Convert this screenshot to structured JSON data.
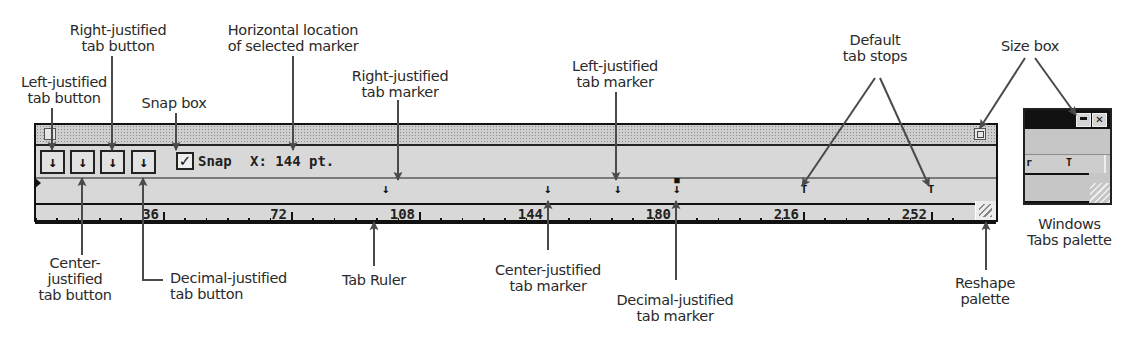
{
  "callouts": {
    "left_justified_tab_button": [
      "Left-justified",
      "tab button"
    ],
    "right_justified_tab_button": [
      "Right-justified",
      "tab button"
    ],
    "snap_box": [
      "Snap box"
    ],
    "horizontal_location": [
      "Horizontal location",
      "of selected marker"
    ],
    "right_justified_tab_marker": [
      "Right-justified",
      "tab marker"
    ],
    "left_justified_tab_marker": [
      "Left-justified",
      "tab marker"
    ],
    "default_tab_stops": [
      "Default",
      "tab stops"
    ],
    "size_box": [
      "Size box"
    ],
    "center_justified_tab_button": [
      "Center-",
      "justified",
      "tab button"
    ],
    "decimal_justified_tab_button": [
      "Decimal-justified",
      "tab button"
    ],
    "tab_ruler": [
      "Tab Ruler"
    ],
    "center_justified_tab_marker": [
      "Center-justified",
      "tab marker"
    ],
    "decimal_justified_tab_marker": [
      "Decimal-justified",
      "tab marker"
    ],
    "reshape_palette": [
      "Reshape",
      "palette"
    ],
    "windows_tabs_palette": [
      "Windows",
      "Tabs palette"
    ]
  },
  "palette": {
    "tab_buttons": [
      {
        "type": "left-justified",
        "glyph": "↓"
      },
      {
        "type": "center-justified",
        "glyph": "↓"
      },
      {
        "type": "right-justified",
        "glyph": "↓"
      },
      {
        "type": "decimal-justified",
        "glyph": "↓"
      }
    ],
    "snap": {
      "checked": true,
      "check_glyph": "✓",
      "label": "Snap"
    },
    "x_position": {
      "label": "X:",
      "value": "144 pt.",
      "display": "X: 144 pt."
    },
    "markers": [
      {
        "type": "right-justified",
        "position_pt": 108,
        "glyph": "↓"
      },
      {
        "type": "center-justified",
        "position_pt": 144,
        "glyph": "↓"
      },
      {
        "type": "left-justified",
        "position_pt": 166,
        "glyph": "↓"
      },
      {
        "type": "decimal-justified",
        "position_pt": 184,
        "glyph": "↓"
      },
      {
        "type": "default",
        "position_pt": 216,
        "glyph": "T"
      },
      {
        "type": "default",
        "position_pt": 252,
        "glyph": "T"
      }
    ],
    "ruler": {
      "unit": "pt",
      "labels": [
        "36",
        "72",
        "108",
        "144",
        "180",
        "216",
        "252"
      ],
      "label_values": [
        36,
        72,
        108,
        144,
        180,
        216,
        252
      ],
      "minor_tick_pt": 6
    }
  },
  "windows_palette": {
    "minimize_label": "",
    "close_label": "✕",
    "markers": [
      "r",
      "T"
    ]
  },
  "colors": {
    "palette_bg": "#d8d8d8",
    "border": "#111111",
    "leader": "#4a4a4a"
  }
}
